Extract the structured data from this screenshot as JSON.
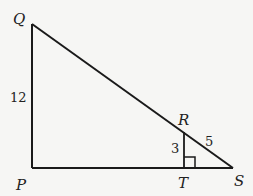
{
  "diagram": {
    "type": "geometry",
    "points": {
      "Q": {
        "label": "Q",
        "x": 32,
        "y": 24
      },
      "P": {
        "label": "P",
        "x": 32,
        "y": 168
      },
      "S": {
        "label": "S",
        "x": 233,
        "y": 168
      },
      "R": {
        "label": "R",
        "x": 184,
        "y": 132
      },
      "T": {
        "label": "T",
        "x": 184,
        "y": 168
      }
    },
    "segment_labels": {
      "PQ": "12",
      "RT": "3",
      "RS": "5"
    },
    "right_angle_marker": "T",
    "colors": {
      "stroke": "#1a1a1a",
      "background": "#f6f6f4"
    }
  }
}
